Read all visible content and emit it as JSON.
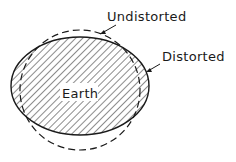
{
  "diagram": {
    "type": "earth-distortion",
    "labels": {
      "undistorted": "Undistorted",
      "distorted": "Distorted",
      "earth": "Earth"
    },
    "colors": {
      "stroke": "#1a1a1a",
      "background": "#ffffff"
    }
  }
}
